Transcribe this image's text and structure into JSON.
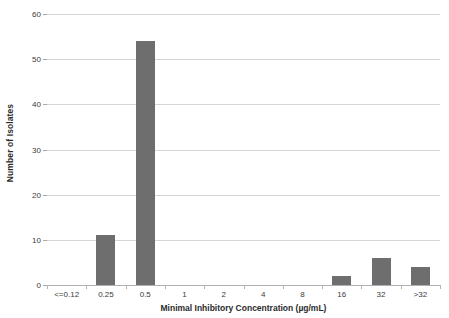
{
  "chart_data": {
    "type": "bar",
    "title": "",
    "xlabel": "Minimal Inhibitory Concentration (µg/mL)",
    "ylabel": "Number of Isolates",
    "categories": [
      "<=0.12",
      "0.25",
      "0.5",
      "1",
      "2",
      "4",
      "8",
      "16",
      "32",
      ">32"
    ],
    "values": [
      0,
      11,
      54,
      0,
      0,
      0,
      0,
      2,
      6,
      4
    ],
    "ylim": [
      0,
      60
    ],
    "yticks": [
      0,
      10,
      20,
      30,
      40,
      50,
      60
    ],
    "ytick_labels": [
      "0",
      "10",
      "20",
      "30",
      "40",
      "50",
      "60"
    ],
    "grid": true,
    "legend": false,
    "series": [
      {
        "name": "Number of Isolates",
        "values": [
          0,
          11,
          54,
          0,
          0,
          0,
          0,
          2,
          6,
          4
        ]
      }
    ],
    "colors": {
      "bar": "#6e6e6e",
      "gridline": "#d6d6d6",
      "axis": "#a8a8a8",
      "text": "#3a3a3a",
      "title_text": "#2b2b2b",
      "background": "#ffffff"
    }
  }
}
